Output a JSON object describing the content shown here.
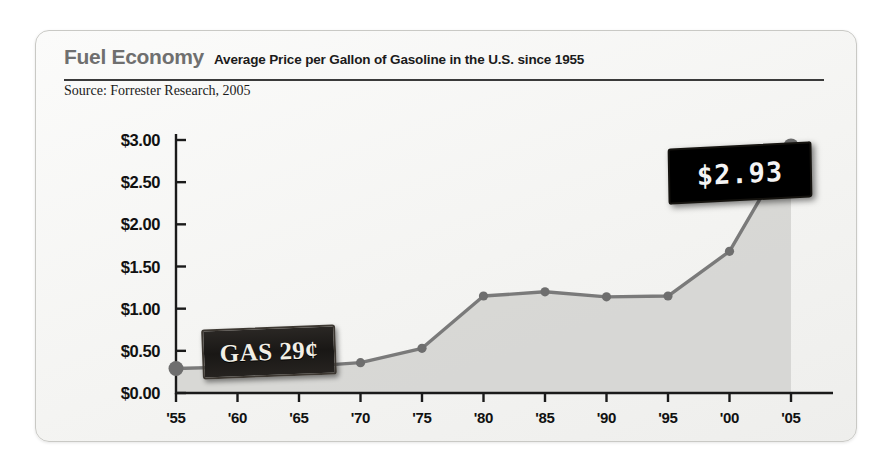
{
  "header": {
    "title": "Fuel Economy",
    "subtitle": "Average Price per Gallon of Gasoline in the U.S. since 1955",
    "source": "Source: Forrester Research, 2005"
  },
  "annotations": {
    "vintage_sign": "GAS 29¢",
    "led_sign": "$2.93"
  },
  "colors": {
    "line": "#7a7a7a",
    "marker": "#6e6e6e",
    "area": "#d2d2d0",
    "axis": "#1a1a1a",
    "title": "#6f6f6f",
    "card_bg": "#f6f6f4"
  },
  "chart_data": {
    "type": "line",
    "title": "Fuel Economy",
    "subtitle": "Average Price per Gallon of Gasoline in the U.S. since 1955",
    "xlabel": "",
    "ylabel": "",
    "categories": [
      "'55",
      "'60",
      "'65",
      "'70",
      "'75",
      "'80",
      "'85",
      "'90",
      "'95",
      "'00",
      "'05"
    ],
    "x_values": [
      1955,
      1960,
      1965,
      1970,
      1975,
      1980,
      1985,
      1990,
      1995,
      2000,
      2005
    ],
    "values": [
      0.29,
      0.31,
      0.31,
      0.36,
      0.53,
      1.15,
      1.2,
      1.14,
      1.15,
      1.68,
      2.93
    ],
    "ytick_labels": [
      "$0.00",
      "$0.50",
      "$1.00",
      "$1.50",
      "$2.00",
      "$2.50",
      "$3.00"
    ],
    "ytick_values": [
      0.0,
      0.5,
      1.0,
      1.5,
      2.0,
      2.5,
      3.0
    ],
    "ylim": [
      0.0,
      3.0
    ],
    "grid": false,
    "legend": "none",
    "fill": "area-under-curve",
    "annotations": [
      "GAS 29¢",
      "$2.93"
    ]
  }
}
